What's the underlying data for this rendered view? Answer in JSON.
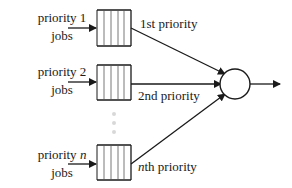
{
  "diagram": {
    "inputs": [
      {
        "line1": "priority 1",
        "line1_italic": "",
        "line2": "jobs",
        "queue_label_prefix": "",
        "queue_label": "1st priority"
      },
      {
        "line1": "priority 2",
        "line1_italic": "",
        "line2": "jobs",
        "queue_label_prefix": "",
        "queue_label": "2nd priority"
      },
      {
        "line1": "priority ",
        "line1_italic": "n",
        "line2": "jobs",
        "queue_label_prefix": "n",
        "queue_label": "th priority"
      }
    ],
    "server": "circle",
    "colors": {
      "stroke": "#1a1a1a",
      "dots": "#d8d8d8"
    }
  }
}
